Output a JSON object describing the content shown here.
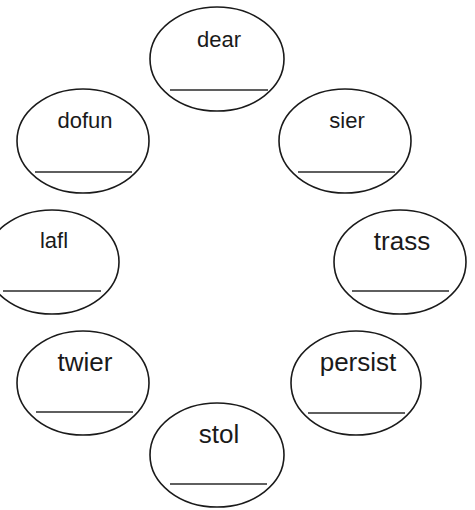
{
  "worksheet": {
    "ovals": [
      {
        "id": "dear",
        "word": "dear",
        "cx": 217,
        "cy": 59,
        "rx": 67,
        "ry": 52,
        "text_y": 47,
        "font_size": 22,
        "line": {
          "x1": 170,
          "x2": 268,
          "y": 90
        }
      },
      {
        "id": "dofun",
        "word": "dofun",
        "cx": 83,
        "cy": 141,
        "rx": 66,
        "ry": 52,
        "text_y": 128,
        "font_size": 22,
        "line": {
          "x1": 35,
          "x2": 132,
          "y": 172
        }
      },
      {
        "id": "sier",
        "word": "sier",
        "cx": 345,
        "cy": 141,
        "rx": 66,
        "ry": 52,
        "text_y": 128,
        "font_size": 22,
        "line": {
          "x1": 298,
          "x2": 395,
          "y": 172
        }
      },
      {
        "id": "lafl",
        "word": "lafl",
        "cx": 52,
        "cy": 262,
        "rx": 67,
        "ry": 52,
        "text_y": 248,
        "font_size": 22,
        "line": {
          "x1": 3,
          "x2": 101,
          "y": 291
        }
      },
      {
        "id": "trass",
        "word": "trass",
        "cx": 400,
        "cy": 262,
        "rx": 66,
        "ry": 52,
        "text_y": 250,
        "font_size": 26,
        "line": {
          "x1": 352,
          "x2": 449,
          "y": 291
        }
      },
      {
        "id": "twier",
        "word": "twier",
        "cx": 83,
        "cy": 383,
        "rx": 66,
        "ry": 52,
        "text_y": 371,
        "font_size": 26,
        "line": {
          "x1": 36,
          "x2": 133,
          "y": 412
        }
      },
      {
        "id": "persist",
        "word": "persist",
        "cx": 356,
        "cy": 383,
        "rx": 65,
        "ry": 52,
        "text_y": 371,
        "font_size": 26,
        "line": {
          "x1": 308,
          "x2": 405,
          "y": 413
        }
      },
      {
        "id": "stol",
        "word": "stol",
        "cx": 217,
        "cy": 455,
        "rx": 67,
        "ry": 52,
        "text_y": 443,
        "font_size": 26,
        "line": {
          "x1": 170,
          "x2": 267,
          "y": 484
        }
      }
    ],
    "colors": {
      "background": "#ffffff",
      "ink": "#1a1a1a"
    }
  }
}
